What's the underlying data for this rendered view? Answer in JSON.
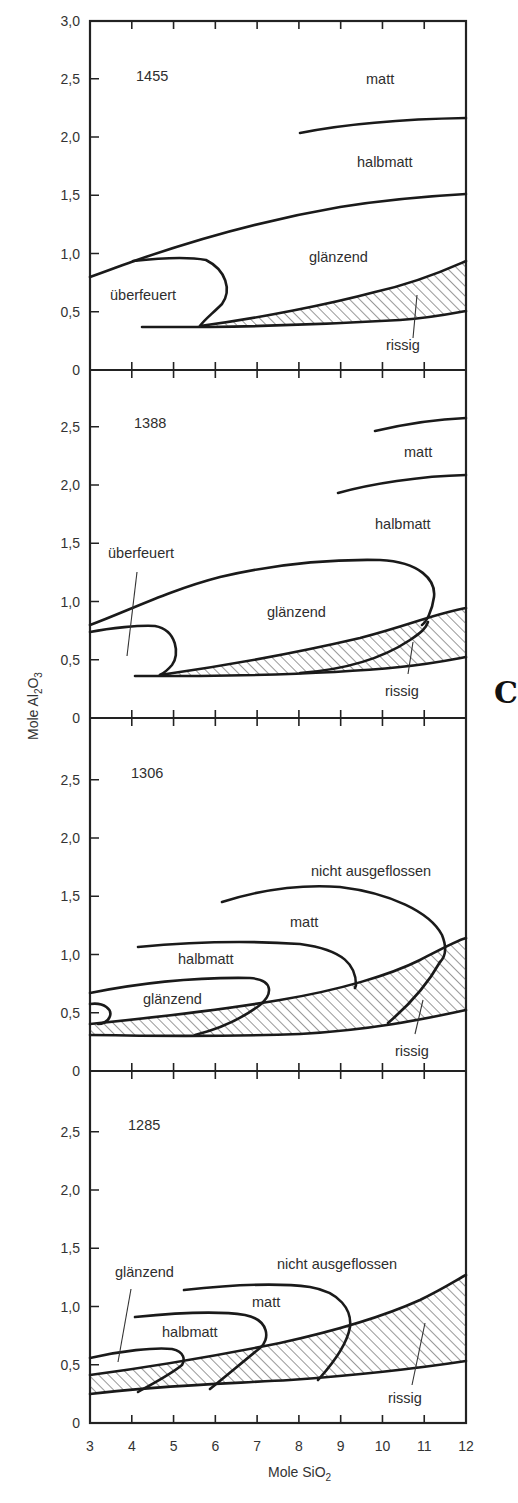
{
  "chart_data": {
    "type": "area",
    "title": "",
    "xlabel": "Mole SiO2",
    "ylabel": "Mole Al2O3",
    "xlim": [
      3,
      12
    ],
    "ylim": [
      0,
      3.0
    ],
    "x_ticks": [
      "3",
      "4",
      "5",
      "6",
      "7",
      "8",
      "9",
      "10",
      "11",
      "12"
    ],
    "y_ticks": [
      "0",
      "0,5",
      "1,0",
      "1,5",
      "2,0",
      "2,5",
      "3,0"
    ],
    "grid": false,
    "legend": "none (regions labeled inline)",
    "panels": [
      {
        "temperature": "1455",
        "regions": [
          "matt",
          "halbmatt",
          "glänzend",
          "überfeuert",
          "rissig"
        ],
        "boundaries": {
          "matt_halbmatt": [
            [
              8.0,
              2.02
            ],
            [
              10,
              2.15
            ],
            [
              12,
              2.2
            ]
          ],
          "halbmatt_glaenzend": [
            [
              3.0,
              0.8
            ],
            [
              4.0,
              0.95
            ],
            [
              6,
              1.17
            ],
            [
              8,
              1.32
            ],
            [
              10,
              1.43
            ],
            [
              12,
              1.5
            ]
          ],
          "ueberfeuert_loop": [
            [
              4.0,
              0.95
            ],
            [
              5.2,
              0.95
            ],
            [
              5.6,
              0.7
            ],
            [
              5.3,
              0.4
            ]
          ],
          "rissig_upper": [
            [
              5.6,
              0.38
            ],
            [
              8,
              0.5
            ],
            [
              10,
              0.65
            ],
            [
              12,
              0.93
            ]
          ],
          "rissig_lower": [
            [
              4.2,
              0.37
            ],
            [
              8,
              0.4
            ],
            [
              10,
              0.43
            ],
            [
              12,
              0.51
            ]
          ]
        }
      },
      {
        "temperature": "1388",
        "regions": [
          "matt",
          "halbmatt",
          "glänzend",
          "überfeuert",
          "rissig"
        ],
        "boundaries": {
          "top_matt": [
            [
              9.8,
              2.47
            ],
            [
              11,
              2.57
            ],
            [
              12,
              2.6
            ]
          ],
          "matt_halbmatt": [
            [
              8.9,
              1.94
            ],
            [
              10,
              2.06
            ],
            [
              12,
              2.1
            ]
          ],
          "glaenzend_loop_upper": [
            [
              3.0,
              0.8
            ],
            [
              5,
              1.1
            ],
            [
              7,
              1.3
            ],
            [
              9,
              1.37
            ],
            [
              10.3,
              1.3
            ],
            [
              10.6,
              1.0
            ],
            [
              10.4,
              0.82
            ]
          ],
          "ueberfeuert_loop": [
            [
              3.0,
              0.75
            ],
            [
              4.5,
              0.82
            ],
            [
              5.1,
              0.62
            ],
            [
              4.7,
              0.38
            ]
          ],
          "rissig_upper": [
            [
              4.8,
              0.38
            ],
            [
              8,
              0.55
            ],
            [
              10,
              0.72
            ],
            [
              12,
              0.95
            ]
          ],
          "rissig_inner": [
            [
              8.5,
              0.4
            ],
            [
              10,
              0.55
            ],
            [
              11.5,
              0.75
            ]
          ],
          "rissig_lower": [
            [
              4.0,
              0.37
            ],
            [
              8,
              0.39
            ],
            [
              10,
              0.43
            ],
            [
              12,
              0.53
            ]
          ]
        }
      },
      {
        "temperature": "1306",
        "regions": [
          "nicht ausgeflossen",
          "matt",
          "halbmatt",
          "glänzend",
          "rissig"
        ],
        "boundaries": {
          "matt_nicht_ausgeflossen": [
            [
              6.2,
              1.45
            ],
            [
              8,
              1.57
            ],
            [
              10,
              1.45
            ],
            [
              11.3,
              1.15
            ],
            [
              11.4,
              1.02
            ]
          ],
          "halbmatt_matt": [
            [
              4.1,
              1.05
            ],
            [
              6,
              1.1
            ],
            [
              8,
              1.05
            ],
            [
              9.2,
              0.85
            ],
            [
              9.3,
              0.7
            ]
          ],
          "glaenzend_halbmatt": [
            [
              3.0,
              0.66
            ],
            [
              5,
              0.8
            ],
            [
              6.7,
              0.77
            ],
            [
              6.3,
              0.6
            ],
            [
              5.5,
              0.43
            ]
          ],
          "small_loop": [
            [
              3.0,
              0.58
            ],
            [
              3.5,
              0.52
            ],
            [
              3.2,
              0.41
            ]
          ],
          "rissig_upper": [
            [
              3.0,
              0.4
            ],
            [
              6,
              0.5
            ],
            [
              9,
              0.72
            ],
            [
              12,
              1.13
            ]
          ],
          "rissig_lower": [
            [
              3.0,
              0.31
            ],
            [
              6,
              0.3
            ],
            [
              9,
              0.35
            ],
            [
              12,
              0.52
            ]
          ]
        }
      },
      {
        "temperature": "1285",
        "regions": [
          "nicht ausgeflossen",
          "matt",
          "halbmatt",
          "glänzend",
          "rissig"
        ],
        "boundaries": {
          "matt_nicht_ausgeflossen": [
            [
              5.2,
              1.13
            ],
            [
              7,
              1.18
            ],
            [
              8.5,
              1.08
            ],
            [
              9.2,
              0.85
            ],
            [
              8.4,
              0.35
            ]
          ],
          "halbmatt_matt": [
            [
              4.0,
              0.92
            ],
            [
              6,
              0.96
            ],
            [
              7.2,
              0.8
            ],
            [
              6.9,
              0.6
            ],
            [
              5.8,
              0.3
            ]
          ],
          "glaenzend_halbmatt": [
            [
              3.0,
              0.56
            ],
            [
              4.5,
              0.64
            ],
            [
              5.2,
              0.55
            ],
            [
              4.2,
              0.27
            ]
          ],
          "rissig_upper": [
            [
              3.0,
              0.41
            ],
            [
              6,
              0.55
            ],
            [
              9,
              0.85
            ],
            [
              11,
              1.13
            ],
            [
              12,
              1.33
            ]
          ],
          "rissig_lower": [
            [
              3.0,
              0.25
            ],
            [
              6,
              0.3
            ],
            [
              9,
              0.38
            ],
            [
              12,
              0.55
            ]
          ]
        }
      }
    ]
  },
  "labels": {
    "panel1": {
      "temp": "1455",
      "matt": "matt",
      "halbmatt": "halbmatt",
      "glaenzend": "glänzend",
      "ueberfeuert": "überfeuert",
      "rissig": "rissig"
    },
    "panel2": {
      "temp": "1388",
      "matt": "matt",
      "halbmatt": "halbmatt",
      "glaenzend": "glänzend",
      "ueberfeuert": "überfeuert",
      "rissig": "rissig"
    },
    "panel3": {
      "temp": "1306",
      "nicht": "nicht ausgeflossen",
      "matt": "matt",
      "halbmatt": "halbmatt",
      "glaenzend": "glänzend",
      "rissig": "rissig"
    },
    "panel4": {
      "temp": "1285",
      "nicht": "nicht ausgeflossen",
      "matt": "matt",
      "halbmatt": "halbmatt",
      "glaenzend": "glänzend",
      "rissig": "rissig"
    }
  },
  "axes": {
    "x_title_main": "Mole  SiO",
    "x_title_sub": "2",
    "y_title_main": "Mole  Al",
    "y_title_sub1": "2",
    "y_title_o": "O",
    "y_title_sub2": "3",
    "x_ticks": [
      "3",
      "4",
      "5",
      "6",
      "7",
      "8",
      "9",
      "10",
      "11",
      "12"
    ],
    "y_ticks_p1": [
      "3,0",
      "2,5",
      "2,0",
      "1,5",
      "1,0",
      "0,5",
      "0"
    ],
    "y_ticks": [
      "2,5",
      "2,0",
      "1,5",
      "1,0",
      "0,5",
      "0"
    ]
  },
  "cutoff_glyph": "C"
}
